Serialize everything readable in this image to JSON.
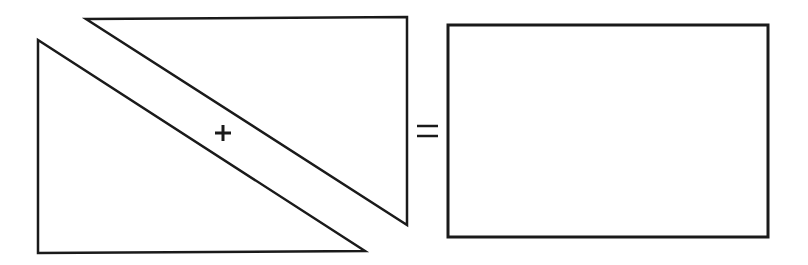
{
  "diagram": {
    "colors": {
      "background": "#ffffff",
      "stroke": "#1a1a1a"
    },
    "shapes": {
      "lower_triangle": {
        "label": "lower-left right triangle",
        "points": [
          [
            38,
            40
          ],
          [
            38,
            253
          ],
          [
            365,
            251
          ]
        ],
        "stroke_width": 2.5
      },
      "upper_triangle": {
        "label": "upper-right right triangle",
        "points": [
          [
            86,
            19
          ],
          [
            407,
            17
          ],
          [
            407,
            225
          ]
        ],
        "stroke_width": 2.5
      },
      "rectangle": {
        "label": "resulting rectangle",
        "x": 448,
        "y": 25,
        "width": 320,
        "height": 212,
        "stroke_width": 3
      }
    },
    "operators": {
      "plus": {
        "symbol": "+",
        "cx": 223,
        "cy": 133,
        "arm": 8,
        "stroke_width": 3
      },
      "equals": {
        "symbol": "=",
        "x1": 417,
        "x2": 438,
        "y_top": 126,
        "y_bottom": 136,
        "stroke_width": 2.5
      }
    }
  }
}
